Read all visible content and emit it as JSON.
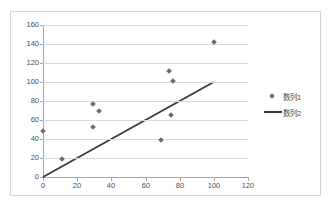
{
  "chart_data": {
    "type": "scatter",
    "title": "",
    "xlabel": "",
    "ylabel": "",
    "xlim": [
      0,
      120
    ],
    "ylim": [
      0,
      160
    ],
    "xticks": [
      "0",
      "20",
      "40",
      "60",
      "80",
      "100",
      "120"
    ],
    "yticks": [
      "0",
      "20",
      "40",
      "60",
      "80",
      "100",
      "120",
      "140",
      "160"
    ],
    "xtick_values": [
      0,
      20,
      40,
      60,
      80,
      100,
      120
    ],
    "ytick_values": [
      0,
      20,
      40,
      60,
      80,
      100,
      120,
      140,
      160
    ],
    "grid": "horizontal",
    "legend_position": "right",
    "series": [
      {
        "name": "数列1",
        "type": "scatter",
        "marker": "diamond",
        "color": "#6b6b6b",
        "points": [
          {
            "x": 0,
            "y": 48
          },
          {
            "x": 11,
            "y": 19
          },
          {
            "x": 29,
            "y": 53
          },
          {
            "x": 29,
            "y": 77
          },
          {
            "x": 33,
            "y": 69
          },
          {
            "x": 69,
            "y": 39
          },
          {
            "x": 74,
            "y": 112
          },
          {
            "x": 75,
            "y": 65
          },
          {
            "x": 76,
            "y": 101
          },
          {
            "x": 100,
            "y": 142
          }
        ]
      },
      {
        "name": "数列2",
        "type": "line",
        "color": "#3a3a3a",
        "points": [
          {
            "x": 0,
            "y": 0
          },
          {
            "x": 100,
            "y": 100
          }
        ]
      }
    ]
  },
  "legend": {
    "items": [
      {
        "label": "数列1",
        "kind": "marker"
      },
      {
        "label": "数列2",
        "kind": "line"
      }
    ]
  }
}
